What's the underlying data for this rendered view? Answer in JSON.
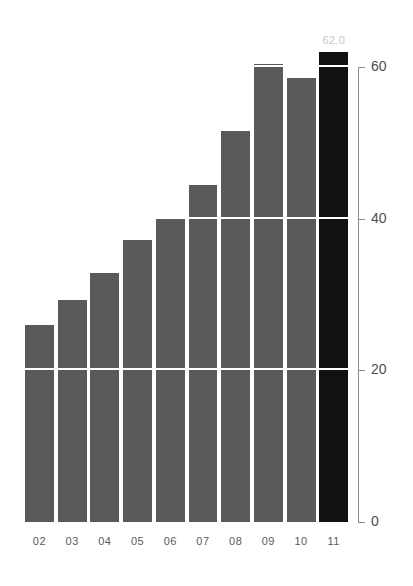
{
  "chart_data": {
    "type": "bar",
    "title": "",
    "subtitle": "",
    "xlabel": "",
    "ylabel": "",
    "categories": [
      "02",
      "03",
      "04",
      "05",
      "06",
      "07",
      "08",
      "09",
      "10",
      "11"
    ],
    "values": [
      26.0,
      29.3,
      32.9,
      37.2,
      40.2,
      44.4,
      51.6,
      60.4,
      58.6,
      62.0
    ],
    "ylim": [
      0,
      65
    ],
    "yticks": [
      0,
      20,
      40,
      60
    ],
    "ytick_labels": [
      "0",
      "20",
      "40",
      "60"
    ],
    "gridlines": [
      20,
      40,
      60
    ],
    "grid": true,
    "grid_color": "#ffffff",
    "legend": "none",
    "legend_position": "none",
    "bar_color": "#5a5a5a",
    "highlight_color": "#111111",
    "highlight_index": 9,
    "annotations": [
      {
        "category": "11",
        "text": "62.0",
        "value": 62.0,
        "color": "#c8c8c8",
        "position": "above-bar"
      }
    ],
    "axis_color": "#8c8c8c",
    "tick_label_color": "#4d4d4d",
    "x_label_color": "#5a5a5a",
    "background": "#ffffff"
  }
}
